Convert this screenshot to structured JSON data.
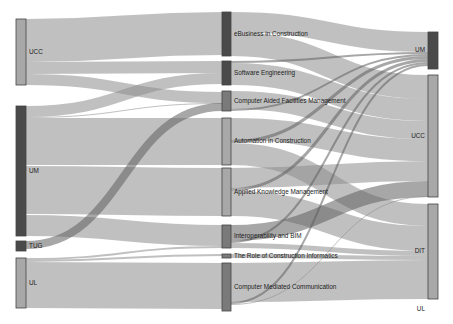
{
  "diagram": {
    "type": "sankey",
    "colors": {
      "link": "#8c8c8c",
      "link_dark": "#5e5e5e",
      "node_dark": "#4a4a4a",
      "node_mid": "#7a7a7a",
      "node_light": "#a8a8a8",
      "node_stroke": "#444444"
    },
    "columns": [
      {
        "x": 16,
        "width": 10,
        "label_side": "right",
        "nodes": [
          {
            "id": "L_UCC",
            "label": "UCC",
            "y0": 19,
            "y1": 85,
            "shade": "node_light"
          },
          {
            "id": "L_UM",
            "label": "UM",
            "y0": 106,
            "y1": 236,
            "shade": "node_dark"
          },
          {
            "id": "L_TUG",
            "label": "TUG",
            "y0": 241,
            "y1": 251,
            "shade": "node_dark"
          },
          {
            "id": "L_UL",
            "label": "UL",
            "y0": 258,
            "y1": 308,
            "shade": "node_light"
          }
        ]
      },
      {
        "x": 222,
        "width": 9,
        "label_side": "right",
        "nodes": [
          {
            "id": "M_EB",
            "label": "eBusiness in Construction",
            "y0": 12,
            "y1": 56,
            "shade": "node_dark"
          },
          {
            "id": "M_SE",
            "label": "Software Engineering",
            "y0": 61,
            "y1": 85,
            "shade": "node_dark"
          },
          {
            "id": "M_CAFM",
            "label": "Computer Aided Facilities Management",
            "y0": 91,
            "y1": 111,
            "shade": "node_mid"
          },
          {
            "id": "M_AC",
            "label": "Automation in Construction",
            "y0": 118,
            "y1": 165,
            "shade": "node_light"
          },
          {
            "id": "M_AKM",
            "label": "Applied Knowledge Management",
            "y0": 168,
            "y1": 216,
            "shade": "node_light"
          },
          {
            "id": "M_IB",
            "label": "Interoperability and BIM",
            "y0": 225,
            "y1": 248,
            "shade": "node_mid"
          },
          {
            "id": "M_RCI",
            "label": "The Role of Construction Informatics",
            "y0": 254,
            "y1": 258,
            "shade": "node_mid"
          },
          {
            "id": "M_CMC",
            "label": "Computer Mediated Communication",
            "y0": 263,
            "y1": 311,
            "shade": "node_mid"
          }
        ]
      },
      {
        "x": 428,
        "width": 10,
        "label_side": "left",
        "nodes": [
          {
            "id": "R_UM",
            "label": "UM",
            "y0": 32,
            "y1": 69,
            "shade": "node_dark"
          },
          {
            "id": "R_UCC",
            "label": "UCC",
            "y0": 75,
            "y1": 197,
            "shade": "node_light"
          },
          {
            "id": "R_DIT",
            "label": "DIT",
            "y0": 204,
            "y1": 299,
            "shade": "node_light"
          },
          {
            "id": "R_UL",
            "label": "UL",
            "y0": 303,
            "y1": 303,
            "shade": "node_light"
          }
        ]
      }
    ],
    "links": [
      {
        "source": "L_UCC",
        "target": "M_EB",
        "sy": 19,
        "ty": 12,
        "w": 43,
        "shade": "link"
      },
      {
        "source": "L_UCC",
        "target": "M_SE",
        "sy": 62,
        "ty": 61,
        "w": 12,
        "shade": "link"
      },
      {
        "source": "L_UCC",
        "target": "M_CAFM",
        "sy": 74,
        "ty": 92,
        "w": 11,
        "shade": "link"
      },
      {
        "source": "L_UM",
        "target": "M_SE",
        "sy": 106,
        "ty": 73,
        "w": 11,
        "shade": "link"
      },
      {
        "source": "L_UM",
        "target": "M_CAFM",
        "sy": 117,
        "ty": 103,
        "w": 1,
        "shade": "link"
      },
      {
        "source": "L_UM",
        "target": "M_AC",
        "sy": 118,
        "ty": 118,
        "w": 47,
        "shade": "link"
      },
      {
        "source": "L_UM",
        "target": "M_AKM",
        "sy": 166,
        "ty": 168,
        "w": 48,
        "shade": "link"
      },
      {
        "source": "L_UM",
        "target": "M_IB",
        "sy": 215,
        "ty": 225,
        "w": 21,
        "shade": "link"
      },
      {
        "source": "L_TUG",
        "target": "M_CAFM",
        "sy": 241,
        "ty": 103,
        "w": 8,
        "shade": "link_dark"
      },
      {
        "source": "L_UL",
        "target": "M_IB",
        "sy": 258,
        "ty": 246,
        "w": 2,
        "shade": "link"
      },
      {
        "source": "L_UL",
        "target": "M_RCI",
        "sy": 260,
        "ty": 254,
        "w": 2,
        "shade": "link"
      },
      {
        "source": "L_UL",
        "target": "M_CMC",
        "sy": 262,
        "ty": 263,
        "w": 46,
        "shade": "link"
      },
      {
        "source": "M_EB",
        "target": "R_UM",
        "sy": 12,
        "ty": 32,
        "w": 20,
        "shade": "link"
      },
      {
        "source": "M_EB",
        "target": "R_UCC",
        "sy": 32,
        "ty": 75,
        "w": 24,
        "shade": "link"
      },
      {
        "source": "M_SE",
        "target": "R_UM",
        "sy": 61,
        "ty": 52,
        "w": 2,
        "shade": "link_dark"
      },
      {
        "source": "M_SE",
        "target": "R_UCC",
        "sy": 63,
        "ty": 99,
        "w": 22,
        "shade": "link"
      },
      {
        "source": "M_CAFM",
        "target": "R_UCC",
        "sy": 91,
        "ty": 121,
        "w": 18,
        "shade": "link"
      },
      {
        "source": "M_CAFM",
        "target": "R_UM",
        "sy": 109,
        "ty": 54,
        "w": 2,
        "shade": "link_dark"
      },
      {
        "source": "M_AC",
        "target": "R_UCC",
        "sy": 118,
        "ty": 139,
        "w": 22,
        "shade": "link"
      },
      {
        "source": "M_AC",
        "target": "R_UM",
        "sy": 140,
        "ty": 56,
        "w": 3,
        "shade": "link_dark"
      },
      {
        "source": "M_AC",
        "target": "R_DIT",
        "sy": 143,
        "ty": 204,
        "w": 22,
        "shade": "link"
      },
      {
        "source": "M_AKM",
        "target": "R_UCC",
        "sy": 168,
        "ty": 161,
        "w": 20,
        "shade": "link"
      },
      {
        "source": "M_AKM",
        "target": "R_UM",
        "sy": 188,
        "ty": 59,
        "w": 3,
        "shade": "link_dark"
      },
      {
        "source": "M_AKM",
        "target": "R_DIT",
        "sy": 191,
        "ty": 226,
        "w": 25,
        "shade": "link"
      },
      {
        "source": "M_IB",
        "target": "R_UCC",
        "sy": 225,
        "ty": 181,
        "w": 16,
        "shade": "link_dark"
      },
      {
        "source": "M_IB",
        "target": "R_UM",
        "sy": 241,
        "ty": 62,
        "w": 2,
        "shade": "link_dark"
      },
      {
        "source": "M_IB",
        "target": "R_DIT",
        "sy": 243,
        "ty": 251,
        "w": 5,
        "shade": "link"
      },
      {
        "source": "M_RCI",
        "target": "R_DIT",
        "sy": 254,
        "ty": 256,
        "w": 4,
        "shade": "link"
      },
      {
        "source": "M_CMC",
        "target": "R_DIT",
        "sy": 263,
        "ty": 260,
        "w": 39,
        "shade": "link"
      },
      {
        "source": "M_CMC",
        "target": "R_UM",
        "sy": 302,
        "ty": 64,
        "w": 2,
        "shade": "link_dark"
      },
      {
        "source": "M_CMC",
        "target": "R_UCC",
        "sy": 304,
        "ty": 196,
        "w": 1,
        "shade": "link"
      }
    ]
  }
}
